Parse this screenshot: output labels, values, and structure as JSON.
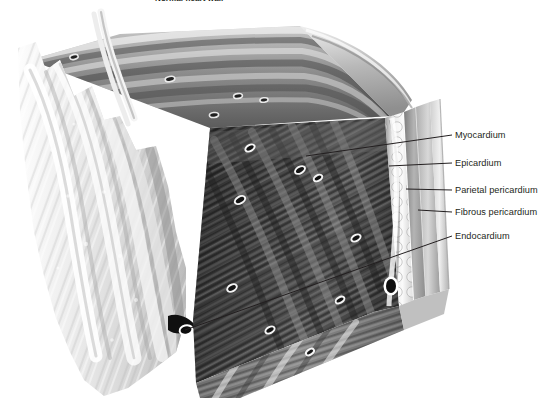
{
  "figure": {
    "title": "Normal heart wall",
    "type": "anatomical-illustration",
    "background_color": "#ffffff",
    "style": "grayscale medical illustration"
  },
  "labels": [
    {
      "id": "myocardium",
      "text": "Myocardium",
      "text_x": 455,
      "text_y": 135,
      "line_from_x": 452,
      "line_from_y": 135,
      "line_to_x": 306,
      "line_to_y": 156
    },
    {
      "id": "epicardium",
      "text": "Epicardium",
      "text_x": 455,
      "text_y": 163,
      "line_from_x": 452,
      "line_from_y": 163,
      "line_to_x": 389,
      "line_to_y": 166
    },
    {
      "id": "parietal-pericardium",
      "text": "Parietal pericardium",
      "text_x": 455,
      "text_y": 190,
      "line_from_x": 452,
      "line_from_y": 190,
      "line_to_x": 406,
      "line_to_y": 189
    },
    {
      "id": "fibrous-pericardium",
      "text": "Fibrous pericardium",
      "text_x": 455,
      "text_y": 212,
      "line_from_x": 452,
      "line_from_y": 212,
      "line_to_x": 418,
      "line_to_y": 210
    },
    {
      "id": "endocardium",
      "text": "Endocardium",
      "text_x": 455,
      "text_y": 236,
      "line_from_x": 452,
      "line_from_y": 236,
      "line_to_x": 185,
      "line_to_y": 330
    }
  ],
  "layers": {
    "endocardium": {
      "name": "Endocardium",
      "tone": "#e9e9e9",
      "note": "trabeculated inner surface, left face"
    },
    "myocardium": {
      "name": "Myocardium",
      "tone": "#3a3a3a",
      "note": "thick dark muscle bundles, central mass"
    },
    "epicardium": {
      "name": "Epicardium",
      "tone": "#d8d8d8",
      "note": "fatty lobulated layer with vessels"
    },
    "parietal_pericardium": {
      "name": "Parietal pericardium",
      "tone": "#bdbdbd",
      "note": "thin serous band"
    },
    "fibrous_pericardium": {
      "name": "Fibrous pericardium",
      "tone": "#cfcfcf",
      "note": "outermost band"
    }
  },
  "colors": {
    "leader_line": "#231f20",
    "label_text": "#231f20",
    "title_text": "#231f20"
  }
}
